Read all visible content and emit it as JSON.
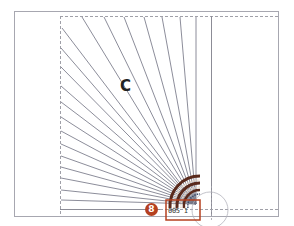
{
  "diagram": {
    "region_label": "C",
    "callout_number": "8",
    "dimension_text": "005 1",
    "colors": {
      "outline": "#9a9aa6",
      "fan_lines": "#6e7080",
      "dashed": "#a0a0a8",
      "callout": "#b5401f",
      "arc_dark": "#5a2a1c",
      "arc_light": "#e8d8c8"
    },
    "fan": {
      "origin": [
        196,
        204
      ],
      "line_count_top": 8,
      "line_count_left": 12
    }
  }
}
